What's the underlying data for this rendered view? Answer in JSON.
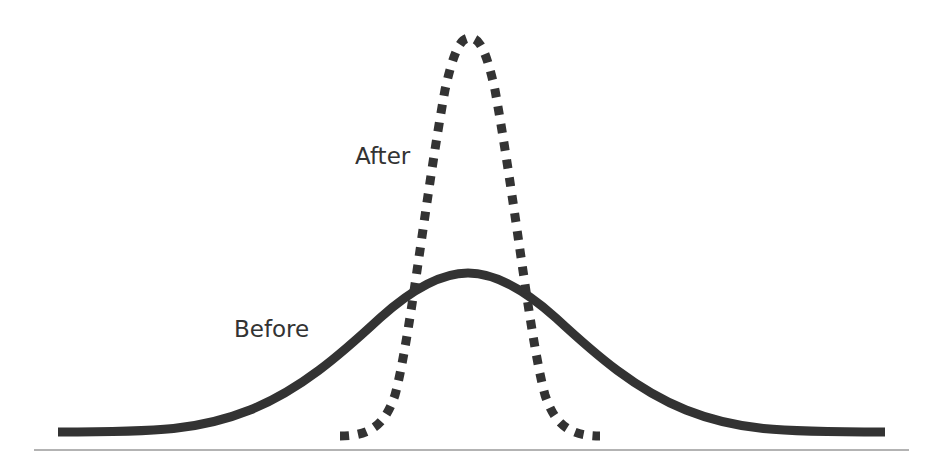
{
  "diagram": {
    "type": "distribution-comparison",
    "labels": {
      "after": "After",
      "before": "Before"
    },
    "series": [
      {
        "name": "Before",
        "style": "solid",
        "shape": "wide normal distribution",
        "color": "#333333",
        "relative_peak_height": 0.39,
        "relative_width": 0.95
      },
      {
        "name": "After",
        "style": "dotted",
        "shape": "narrow normal distribution",
        "color": "#333333",
        "relative_peak_height": 1.0,
        "relative_width": 0.3
      }
    ],
    "baseline": {
      "color": "#9a9a9a"
    }
  },
  "colors": {
    "background": "#ffffff",
    "curve": "#333333",
    "baseline": "#9a9a9a",
    "text": "#333333"
  }
}
